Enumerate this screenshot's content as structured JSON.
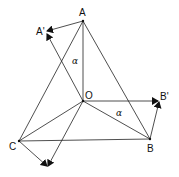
{
  "diagram": {
    "type": "geometric rotation diagram",
    "points": {
      "A": {
        "label": "A",
        "x": 83,
        "y": 21
      },
      "A_prime": {
        "label": "A'",
        "x": 46,
        "y": 32
      },
      "O": {
        "label": "O",
        "x": 83,
        "y": 101
      },
      "B": {
        "label": "B",
        "x": 150,
        "y": 139
      },
      "B_prime": {
        "label": "B'",
        "x": 159,
        "y": 101
      },
      "C": {
        "label": "C",
        "x": 19,
        "y": 141
      },
      "C_prime": {
        "label": "",
        "x": 48,
        "y": 167
      }
    },
    "angle_labels": [
      {
        "label": "α",
        "x": 74,
        "y": 62
      },
      {
        "label": "α",
        "x": 118,
        "y": 115
      }
    ],
    "colors": {
      "stroke": "#222222",
      "background": "#ffffff"
    }
  }
}
